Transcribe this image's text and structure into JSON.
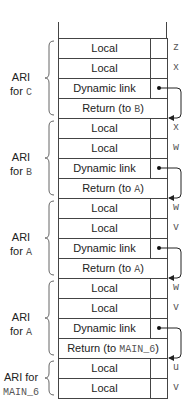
{
  "stack": {
    "rows": [
      {
        "text": "Local",
        "var": "z",
        "kind": "local"
      },
      {
        "text": "Local",
        "var": "x",
        "kind": "local"
      },
      {
        "text": "Dynamic link",
        "var": "",
        "kind": "dynlink"
      },
      {
        "text_prefix": "Return (to ",
        "text_code": "B",
        "text_suffix": ")",
        "var": "",
        "kind": "return"
      },
      {
        "text": "Local",
        "var": "x",
        "kind": "local"
      },
      {
        "text": "Local",
        "var": "w",
        "kind": "local"
      },
      {
        "text": "Dynamic link",
        "var": "",
        "kind": "dynlink"
      },
      {
        "text_prefix": "Return (to ",
        "text_code": "A",
        "text_suffix": ")",
        "var": "",
        "kind": "return"
      },
      {
        "text": "Local",
        "var": "w",
        "kind": "local"
      },
      {
        "text": "Local",
        "var": "v",
        "kind": "local"
      },
      {
        "text": "Dynamic link",
        "var": "",
        "kind": "dynlink"
      },
      {
        "text_prefix": "Return (to ",
        "text_code": "A",
        "text_suffix": ")",
        "var": "",
        "kind": "return"
      },
      {
        "text": "Local",
        "var": "w",
        "kind": "local"
      },
      {
        "text": "Local",
        "var": "v",
        "kind": "local"
      },
      {
        "text": "Dynamic link",
        "var": "",
        "kind": "dynlink"
      },
      {
        "text_prefix": "Return (to ",
        "text_code": "MAIN_6",
        "text_suffix": ")",
        "var": "",
        "kind": "return"
      },
      {
        "text": "Local",
        "var": "u",
        "kind": "local"
      },
      {
        "text": "Local",
        "var": "v",
        "kind": "local"
      }
    ]
  },
  "groups": [
    {
      "line1": "ARI",
      "line2_prefix": "for ",
      "line2_code": "C"
    },
    {
      "line1": "ARI",
      "line2_prefix": "for ",
      "line2_code": "B"
    },
    {
      "line1": "ARI",
      "line2_prefix": "for ",
      "line2_code": "A"
    },
    {
      "line1": "ARI",
      "line2_prefix": "for ",
      "line2_code": "A"
    },
    {
      "line1": "ARI for",
      "line2_prefix": "",
      "line2_code": "MAIN_6"
    }
  ]
}
